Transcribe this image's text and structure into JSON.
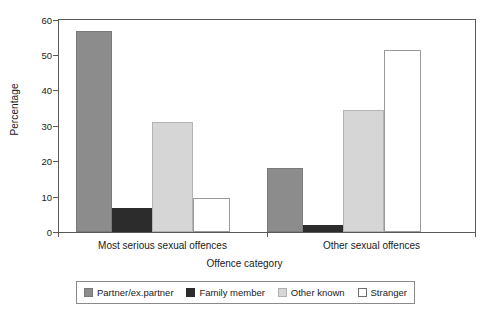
{
  "chart_data": {
    "type": "bar",
    "title": "",
    "xlabel": "Offence category",
    "ylabel": "Percentage",
    "categories": [
      "Most serious sexual offences",
      "Other sexual offences"
    ],
    "series": [
      {
        "name": "Partner/ex.partner",
        "values": [
          56.5,
          18.0
        ],
        "color": "#8c8c8c"
      },
      {
        "name": "Family member",
        "values": [
          6.8,
          2.0
        ],
        "color": "#2c2c2c"
      },
      {
        "name": "Other known",
        "values": [
          31.0,
          34.3
        ],
        "color": "#d6d6d6"
      },
      {
        "name": "Stranger",
        "values": [
          9.5,
          51.3
        ],
        "color": "#ffffff"
      }
    ],
    "ylim": [
      0,
      60
    ],
    "yticks": [
      0,
      10,
      20,
      30,
      40,
      50,
      60
    ],
    "ytick_labels": [
      "0",
      "10",
      "20",
      "30",
      "40",
      "50",
      "60"
    ],
    "grid": false,
    "legend_position": "bottom"
  },
  "axes": {
    "y_title": "Percentage",
    "x_title": "Offence category",
    "y_labels": [
      "60",
      "50",
      "40",
      "30",
      "20",
      "10",
      "0"
    ]
  },
  "groups": [
    {
      "label": "Most serious sexual offences"
    },
    {
      "label": "Other sexual offences"
    }
  ],
  "legend": {
    "items": [
      {
        "label": "Partner/ex.partner",
        "swatch": "partner-swatch"
      },
      {
        "label": "Family member",
        "swatch": "family-swatch"
      },
      {
        "label": "Other known",
        "swatch": "other-known-swatch"
      },
      {
        "label": "Stranger",
        "swatch": "stranger-swatch"
      }
    ]
  }
}
